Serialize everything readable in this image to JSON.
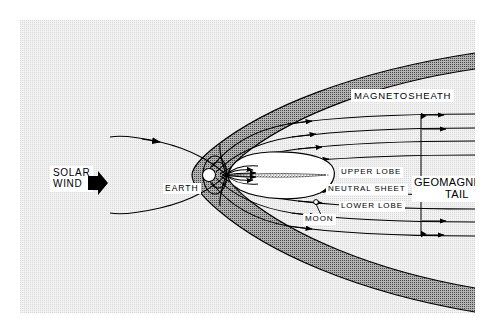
{
  "figure": {
    "type": "schematic-diagram",
    "background_color": "#f2f2f2",
    "sheath_color": "#a8a8a8",
    "line_color": "#000000"
  },
  "labels": {
    "magnetosheath": "MAGNETOSHEATH",
    "solar_wind_line1": "SOLAR",
    "solar_wind_line2": "WIND",
    "earth": "EARTH",
    "upper_lobe": "UPPER LOBE",
    "neutral_sheet": "NEUTRAL SHEET",
    "lower_lobe": "LOWER LOBE",
    "moon": "MOON",
    "geomagnetic_tail_line1": "GEOMAGNETIC",
    "geomagnetic_tail_line2": "TAIL"
  },
  "icons": {
    "solar_wind_arrow": "solar-wind-arrow-icon",
    "moon_marker": "moon-marker-icon",
    "tail_height_dimension": "double-headed-vertical-arrow-icon"
  },
  "features": {
    "bow_shock": "outer parabolic boundary opening to the left around the magnetosphere",
    "magnetopause": "inner boundary enclosing the white magnetospheric cavity",
    "magnetosheath_region": "shaded band between bow shock and magnetopause",
    "field_line_direction": "anti-sunward (arrowheads point right) along the tail lobes",
    "plasma_sheet": "closed oval downstream of Earth containing the neutral sheet",
    "dipole_field": "closed loops around Earth"
  }
}
